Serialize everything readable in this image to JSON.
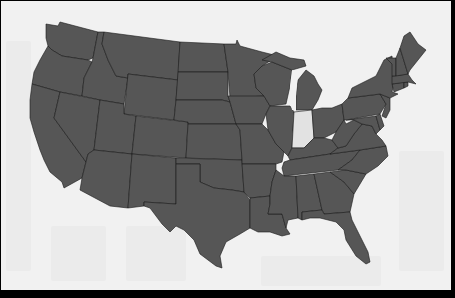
{
  "map": {
    "title": "",
    "region": "Contiguous United States",
    "colors": {
      "background": "#f1f1f1",
      "frame": "#000000",
      "state_fill": "#565656",
      "state_border": "#1a1a1a",
      "highlight_fill": "#e2e2e2"
    },
    "highlighted_state": "Indiana",
    "states": [
      {
        "name": "Washington",
        "highlighted": false
      },
      {
        "name": "Oregon",
        "highlighted": false
      },
      {
        "name": "California",
        "highlighted": false
      },
      {
        "name": "Idaho",
        "highlighted": false
      },
      {
        "name": "Nevada",
        "highlighted": false
      },
      {
        "name": "Montana",
        "highlighted": false
      },
      {
        "name": "Wyoming",
        "highlighted": false
      },
      {
        "name": "Utah",
        "highlighted": false
      },
      {
        "name": "Arizona",
        "highlighted": false
      },
      {
        "name": "Colorado",
        "highlighted": false
      },
      {
        "name": "New Mexico",
        "highlighted": false
      },
      {
        "name": "North Dakota",
        "highlighted": false
      },
      {
        "name": "South Dakota",
        "highlighted": false
      },
      {
        "name": "Nebraska",
        "highlighted": false
      },
      {
        "name": "Kansas",
        "highlighted": false
      },
      {
        "name": "Oklahoma",
        "highlighted": false
      },
      {
        "name": "Texas",
        "highlighted": false
      },
      {
        "name": "Minnesota",
        "highlighted": false
      },
      {
        "name": "Iowa",
        "highlighted": false
      },
      {
        "name": "Missouri",
        "highlighted": false
      },
      {
        "name": "Arkansas",
        "highlighted": false
      },
      {
        "name": "Louisiana",
        "highlighted": false
      },
      {
        "name": "Wisconsin",
        "highlighted": false
      },
      {
        "name": "Illinois",
        "highlighted": false
      },
      {
        "name": "Michigan",
        "highlighted": false
      },
      {
        "name": "Indiana",
        "highlighted": true
      },
      {
        "name": "Ohio",
        "highlighted": false
      },
      {
        "name": "Kentucky",
        "highlighted": false
      },
      {
        "name": "Tennessee",
        "highlighted": false
      },
      {
        "name": "Mississippi",
        "highlighted": false
      },
      {
        "name": "Alabama",
        "highlighted": false
      },
      {
        "name": "Georgia",
        "highlighted": false
      },
      {
        "name": "Florida",
        "highlighted": false
      },
      {
        "name": "South Carolina",
        "highlighted": false
      },
      {
        "name": "North Carolina",
        "highlighted": false
      },
      {
        "name": "Virginia",
        "highlighted": false
      },
      {
        "name": "West Virginia",
        "highlighted": false
      },
      {
        "name": "Maryland",
        "highlighted": false
      },
      {
        "name": "Delaware",
        "highlighted": false
      },
      {
        "name": "Pennsylvania",
        "highlighted": false
      },
      {
        "name": "New Jersey",
        "highlighted": false
      },
      {
        "name": "New York",
        "highlighted": false
      },
      {
        "name": "Connecticut",
        "highlighted": false
      },
      {
        "name": "Rhode Island",
        "highlighted": false
      },
      {
        "name": "Massachusetts",
        "highlighted": false
      },
      {
        "name": "Vermont",
        "highlighted": false
      },
      {
        "name": "New Hampshire",
        "highlighted": false
      },
      {
        "name": "Maine",
        "highlighted": false
      }
    ]
  }
}
